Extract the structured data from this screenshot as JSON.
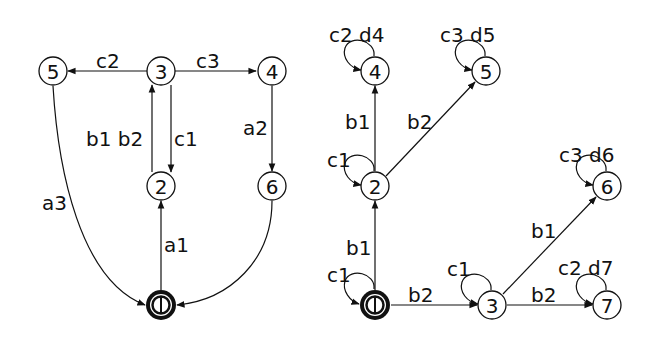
{
  "diagrams": [
    {
      "name": "left-automaton",
      "nodes": [
        {
          "id": "5",
          "label": "5",
          "x": 53,
          "y": 71,
          "accepting": false
        },
        {
          "id": "3",
          "label": "3",
          "x": 161,
          "y": 71,
          "accepting": false
        },
        {
          "id": "4",
          "label": "4",
          "x": 272,
          "y": 71,
          "accepting": false
        },
        {
          "id": "2",
          "label": "2",
          "x": 161,
          "y": 186,
          "accepting": false
        },
        {
          "id": "6",
          "label": "6",
          "x": 272,
          "y": 186,
          "accepting": false
        },
        {
          "id": "0",
          "label": "0",
          "x": 161,
          "y": 305,
          "accepting": true
        }
      ],
      "edges": [
        {
          "from": "3",
          "to": "5",
          "label": "c2"
        },
        {
          "from": "3",
          "to": "4",
          "label": "c3"
        },
        {
          "from": "2",
          "to": "3",
          "label": "b1 b2"
        },
        {
          "from": "3",
          "to": "2",
          "label": "c1"
        },
        {
          "from": "4",
          "to": "6",
          "label": "a2"
        },
        {
          "from": "0",
          "to": "2",
          "label": "a1"
        },
        {
          "from": "5",
          "to": "0",
          "label": "a3"
        },
        {
          "from": "6",
          "to": "0",
          "label": ""
        }
      ]
    },
    {
      "name": "right-automaton",
      "nodes": [
        {
          "id": "4",
          "label": "4",
          "x": 375,
          "y": 71,
          "accepting": false
        },
        {
          "id": "5",
          "label": "5",
          "x": 486,
          "y": 71,
          "accepting": false
        },
        {
          "id": "2",
          "label": "2",
          "x": 375,
          "y": 186,
          "accepting": false
        },
        {
          "id": "6",
          "label": "6",
          "x": 607,
          "y": 186,
          "accepting": false
        },
        {
          "id": "0",
          "label": "0",
          "x": 375,
          "y": 305,
          "accepting": true
        },
        {
          "id": "3",
          "label": "3",
          "x": 492,
          "y": 305,
          "accepting": false
        },
        {
          "id": "7",
          "label": "7",
          "x": 607,
          "y": 305,
          "accepting": false
        }
      ],
      "edges": [
        {
          "from": "4",
          "to": "4",
          "label": "c2 d4"
        },
        {
          "from": "5",
          "to": "5",
          "label": "c3 d5"
        },
        {
          "from": "2",
          "to": "4",
          "label": "b1"
        },
        {
          "from": "2",
          "to": "5",
          "label": "b2"
        },
        {
          "from": "2",
          "to": "2",
          "label": "c1"
        },
        {
          "from": "6",
          "to": "6",
          "label": "c3 d6"
        },
        {
          "from": "0",
          "to": "2",
          "label": "b1"
        },
        {
          "from": "0",
          "to": "0",
          "label": "c1"
        },
        {
          "from": "0",
          "to": "3",
          "label": "b2"
        },
        {
          "from": "3",
          "to": "3",
          "label": "c1"
        },
        {
          "from": "3",
          "to": "6",
          "label": "b1"
        },
        {
          "from": "3",
          "to": "7",
          "label": "b2"
        },
        {
          "from": "7",
          "to": "7",
          "label": "c2 d7"
        }
      ]
    }
  ],
  "labels": {
    "L_n5": "5",
    "L_n3": "3",
    "L_n4": "4",
    "L_n2": "2",
    "L_n6": "6",
    "L_n0": "0",
    "L_c2": "c2",
    "L_c3": "c3",
    "L_b1b2": "b1 b2",
    "L_c1": "c1",
    "L_a2": "a2",
    "L_a1": "a1",
    "L_a3": "a3",
    "R_n4": "4",
    "R_n5": "5",
    "R_n2": "2",
    "R_n6": "6",
    "R_n0": "0",
    "R_n3": "3",
    "R_n7": "7",
    "R_c2d4": "c2 d4",
    "R_c3d5": "c3 d5",
    "R_b1_24": "b1",
    "R_b2_25": "b2",
    "R_c1_2": "c1",
    "R_c3d6": "c3 d6",
    "R_b1_02": "b1",
    "R_c1_0": "c1",
    "R_b2_03": "b2",
    "R_c1_3": "c1",
    "R_b1_36": "b1",
    "R_b2_37": "b2",
    "R_c2d7": "c2 d7"
  }
}
